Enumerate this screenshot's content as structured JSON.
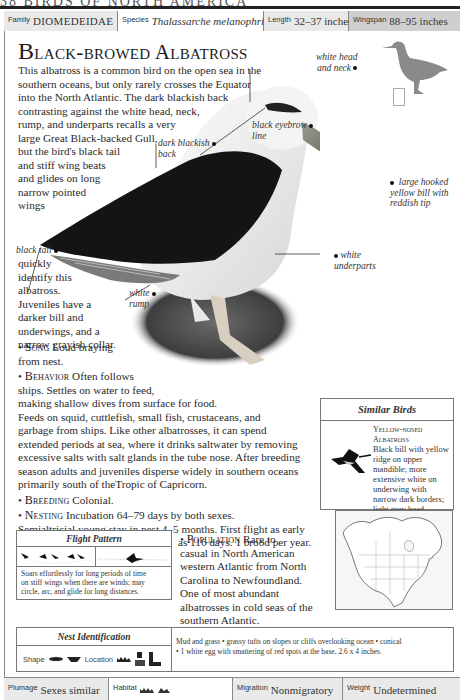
{
  "page_header": {
    "text": "38   BIRDS OF NORTH AMERICA"
  },
  "info_bar": {
    "family": {
      "label": "Family",
      "value": "DIOMEDEIDAE"
    },
    "species": {
      "label": "Species",
      "value": "Thalassarche melanophris"
    },
    "length": {
      "label": "Length",
      "value": "32–37 inches"
    },
    "wingspan": {
      "label": "Wingspan",
      "value": "88–95 inches"
    }
  },
  "title": "Black-browed Albatross",
  "intro_lines": [
    "This albatross is a common bird on the open sea in the",
    "southern oceans, but only rarely crosses the Equator",
    "into the North Atlantic. The dark blackish back",
    "contrasting against the white head, neck,",
    "rump, and underparts recalls a very",
    "large Great Black-backed Gull,",
    "but the bird's black tail",
    "and stiff wing beats",
    "and glides on long",
    "narrow pointed",
    "wings"
  ],
  "tail_text_lines": [
    "quickly",
    "identify this",
    "albatross.",
    "Juveniles have a",
    "darker bill and",
    "underwings, and a",
    "narrow grayish collar."
  ],
  "callouts": {
    "white_head": [
      "white head",
      "and neck"
    ],
    "black_eyebrow": [
      "black eyebrow",
      "line"
    ],
    "dark_back": [
      "dark blackish",
      "back"
    ],
    "bill": [
      "large hooked",
      "yellow bill with",
      "reddish tip"
    ],
    "black_tail": [
      "black tail"
    ],
    "white_underparts": [
      "white",
      "underparts"
    ],
    "white_rump": [
      "white",
      "rump"
    ]
  },
  "sections": {
    "song": {
      "heading": "Song",
      "lines": [
        "Loud braying",
        "from nest."
      ]
    },
    "behavior": {
      "heading": "Behavior",
      "lines": [
        "Often follows",
        "ships. Settles on water to feed,",
        "making shallow dives from surface for food.",
        "Feeds on squid, cuttlefish, small fish, crustaceans, and",
        "garbage from ships. Like other albatrosses, it can spend",
        "extended periods at sea, where it drinks saltwater by removing",
        "excessive salts with salt glands in the tube nose. After breeding",
        "season adults and juveniles disperse widely in southern oceans",
        "primarily south of theTropic of Capricorn."
      ]
    },
    "breeding": {
      "heading": "Breeding",
      "text": "Colonial."
    },
    "nesting": {
      "heading": "Nesting",
      "lines": [
        "Incubation 64–79 days by both sexes.",
        "Semialtricial young stay in nest 4–5 months. First flight as early",
        "as 116 days. 1 brood per year."
      ]
    },
    "population": {
      "heading": "Population",
      "lines": [
        "Rare to",
        "casual in North American",
        "western Atlantic from North",
        "Carolina to Newfoundland.",
        "One of most abundant",
        "albatrosses in cold seas of the",
        "southern Atlantic."
      ]
    }
  },
  "similar_birds": {
    "title": "Similar Birds",
    "name_lines": [
      "Yellow-nosed",
      "Albatross"
    ],
    "desc_lines": [
      "Black bill with yellow",
      "ridge on upper",
      "mandible; more",
      "extensive white on",
      "underwing with",
      "narrow dark borders;",
      "light gray head."
    ]
  },
  "flight_pattern": {
    "title": "Flight Pattern",
    "desc_lines": [
      "Soars effortlessly for long periods of time",
      "on stiff wings when there are winds; may",
      "circle, arc, and glide for long distances."
    ]
  },
  "nest_identification": {
    "title": "Nest Identification",
    "shape_label": "Shape",
    "location_label": "Location",
    "desc_lines": [
      "Mud and grass • grassy tufts on slopes or cliffs overlooking ocean • conical",
      "• 1 white egg with smattering of red spots at the base, 2.6 x 4 inches."
    ]
  },
  "footer": {
    "plumage": {
      "label": "Plumage",
      "value": "Sexes similar"
    },
    "habitat": {
      "label": "Habitat",
      "icons": [
        "ocean-icon",
        "coast-icon"
      ]
    },
    "migration": {
      "label": "Migration",
      "value": "Nonmigratory"
    },
    "weight": {
      "label": "Weight",
      "value": "Undetermined"
    }
  },
  "colors": {
    "cell_gray": "#e9e9e9",
    "cell_dark_gray": "#cfcfcf",
    "silhouette_gray": "#8a8a8a",
    "rule": "#222222"
  }
}
